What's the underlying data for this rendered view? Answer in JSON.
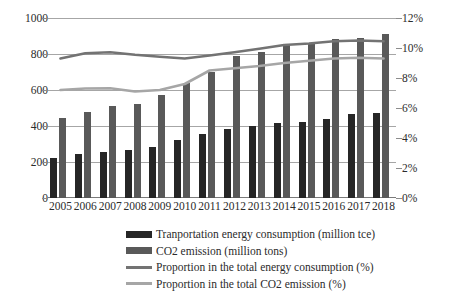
{
  "chart_data": {
    "type": "bar",
    "title": "",
    "subtitle": "",
    "xlabel": "",
    "ylabel": "",
    "y2label": "",
    "categories": [
      "2005",
      "2006",
      "2007",
      "2008",
      "2009",
      "2010",
      "2011",
      "2012",
      "2013",
      "2014",
      "2015",
      "2016",
      "2017",
      "2018"
    ],
    "grid": true,
    "legend_position": "bottom",
    "axes": {
      "left": {
        "ticks": [
          "0",
          "200",
          "400",
          "600",
          "800",
          "1000"
        ],
        "values": [
          0,
          200,
          400,
          600,
          800,
          1000
        ],
        "ylim": [
          0,
          1000
        ]
      },
      "right": {
        "ticks": [
          "0%",
          "2%",
          "4%",
          "6%",
          "8%",
          "10%",
          "12%"
        ],
        "values": [
          0,
          2,
          4,
          6,
          8,
          10,
          12
        ],
        "ylim": [
          0,
          12
        ]
      }
    },
    "series": [
      {
        "name": "Tranportation energy consumption (million tce)",
        "type": "bar",
        "axis": "left",
        "color": "#262626",
        "values": [
          225,
          245,
          258,
          265,
          285,
          320,
          358,
          385,
          402,
          418,
          422,
          440,
          465,
          475
        ]
      },
      {
        "name": "CO2 emission (million tons)",
        "type": "bar",
        "axis": "left",
        "color": "#595959",
        "values": [
          445,
          478,
          512,
          522,
          570,
          640,
          700,
          790,
          810,
          848,
          862,
          882,
          888,
          912
        ]
      },
      {
        "name": "Proportion in the total energy consumption (%)",
        "type": "line",
        "axis": "right",
        "color": "#737373",
        "values": [
          9.3,
          9.65,
          9.72,
          9.55,
          9.42,
          9.3,
          9.5,
          9.72,
          9.95,
          10.2,
          10.3,
          10.45,
          10.5,
          10.45
        ]
      },
      {
        "name": "Proportion in the total CO2 emission (%)",
        "type": "line",
        "axis": "right",
        "color": "#a6a6a6",
        "values": [
          7.2,
          7.3,
          7.32,
          7.1,
          7.2,
          7.6,
          8.5,
          8.65,
          8.8,
          9.0,
          9.15,
          9.3,
          9.35,
          9.3
        ]
      }
    ]
  },
  "legend": {
    "items": [
      {
        "label": "Tranportation energy consumption (million tce)",
        "marker": "bar",
        "color": "#262626"
      },
      {
        "label": "CO2 emission (million tons)",
        "marker": "bar",
        "color": "#595959"
      },
      {
        "label": "Proportion in the total energy consumption (%)",
        "marker": "line",
        "color": "#737373"
      },
      {
        "label": "Proportion in the total CO2 emission (%)",
        "marker": "line",
        "color": "#a6a6a6"
      }
    ]
  }
}
